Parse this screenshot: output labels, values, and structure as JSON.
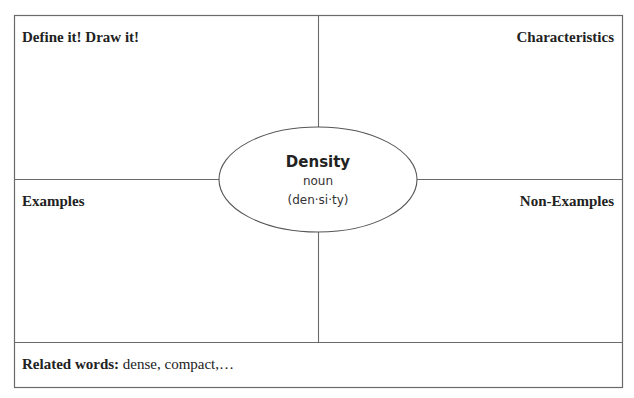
{
  "organizer": {
    "quadrants": {
      "top_left": "Define it! Draw it!",
      "top_right": "Characteristics",
      "bottom_left": "Examples",
      "bottom_right": "Non-Examples"
    },
    "center": {
      "term": "Density",
      "part_of_speech": "noun",
      "syllables": "(den·si·ty)"
    },
    "related": {
      "label": "Related words:",
      "value": " dense, compact,…"
    }
  },
  "colors": {
    "line": "#666666",
    "text": "#222222",
    "background": "#ffffff"
  }
}
